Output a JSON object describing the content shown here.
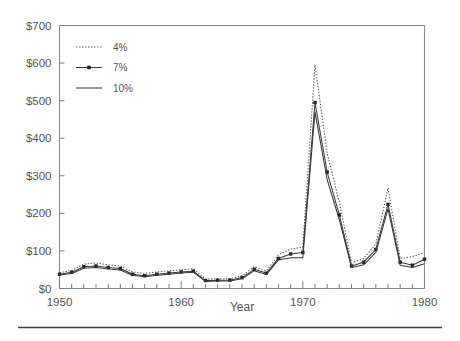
{
  "chart_data": {
    "type": "line",
    "title": "",
    "xlabel": "Year",
    "ylabel": "",
    "xlim": [
      1950,
      1980
    ],
    "ylim": [
      0,
      700
    ],
    "grid": false,
    "legend_position": "top-left",
    "x_tick_labels": [
      "1950",
      "1960",
      "1970",
      "1980"
    ],
    "x_tick_values": [
      1950,
      1960,
      1970,
      1980
    ],
    "x_minor_tick_step": 1,
    "y_tick_labels": [
      "$0",
      "$100",
      "$200",
      "$300",
      "$400",
      "$500",
      "$600",
      "$700"
    ],
    "y_tick_values": [
      0,
      100,
      200,
      300,
      400,
      500,
      600,
      700
    ],
    "x": [
      1950,
      1951,
      1952,
      1953,
      1954,
      1955,
      1956,
      1957,
      1958,
      1959,
      1960,
      1961,
      1962,
      1963,
      1964,
      1965,
      1966,
      1967,
      1968,
      1969,
      1970,
      1971,
      1972,
      1973,
      1974,
      1975,
      1976,
      1977,
      1978,
      1979,
      1980
    ],
    "series": [
      {
        "name": "4%",
        "style": "dotted",
        "markers": false,
        "values": [
          42,
          48,
          65,
          68,
          63,
          60,
          44,
          40,
          44,
          47,
          50,
          52,
          25,
          26,
          26,
          34,
          58,
          47,
          90,
          105,
          110,
          595,
          360,
          230,
          68,
          80,
          118,
          268,
          80,
          85,
          95
        ]
      },
      {
        "name": "7%",
        "style": "solid",
        "markers": true,
        "values": [
          38,
          43,
          58,
          60,
          56,
          53,
          38,
          34,
          38,
          41,
          44,
          46,
          21,
          22,
          22,
          29,
          51,
          41,
          80,
          92,
          96,
          495,
          310,
          196,
          60,
          70,
          104,
          224,
          70,
          62,
          78
        ]
      },
      {
        "name": "10%",
        "style": "solid",
        "markers": false,
        "values": [
          36,
          40,
          54,
          56,
          52,
          49,
          35,
          31,
          35,
          38,
          41,
          43,
          19,
          20,
          20,
          26,
          47,
          37,
          76,
          82,
          82,
          470,
          290,
          183,
          56,
          63,
          96,
          212,
          62,
          56,
          66
        ]
      }
    ]
  },
  "legend": {
    "items": [
      {
        "label": "4%"
      },
      {
        "label": "7%"
      },
      {
        "label": "10%"
      }
    ]
  },
  "axis": {
    "x_title": "Year"
  },
  "colors": {
    "line": "#3a3a3a",
    "dotted": "#5a5a5a",
    "frame": "#8a8a8a",
    "text": "#555555",
    "background": "#ffffff"
  }
}
